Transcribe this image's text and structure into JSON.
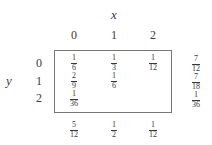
{
  "table": {
    "x_label": "x",
    "y_label": "y",
    "col_headers": [
      "0",
      "1",
      "2"
    ],
    "row_headers": [
      "0",
      "1",
      "2"
    ],
    "cells": [
      [
        {
          "num": "1",
          "den": "6"
        },
        {
          "num": "1",
          "den": "3"
        },
        {
          "num": "1",
          "den": "12"
        }
      ],
      [
        {
          "num": "2",
          "den": "9"
        },
        {
          "num": "1",
          "den": "6"
        },
        null
      ],
      [
        {
          "num": "1",
          "den": "36"
        },
        null,
        null
      ]
    ],
    "row_marginals": [
      {
        "num": "7",
        "den": "12"
      },
      {
        "num": "7",
        "den": "18"
      },
      {
        "num": "1",
        "den": "36"
      }
    ],
    "col_marginals": [
      {
        "num": "5",
        "den": "12"
      },
      {
        "num": "1",
        "den": "2"
      },
      {
        "num": "1",
        "den": "12"
      }
    ]
  }
}
